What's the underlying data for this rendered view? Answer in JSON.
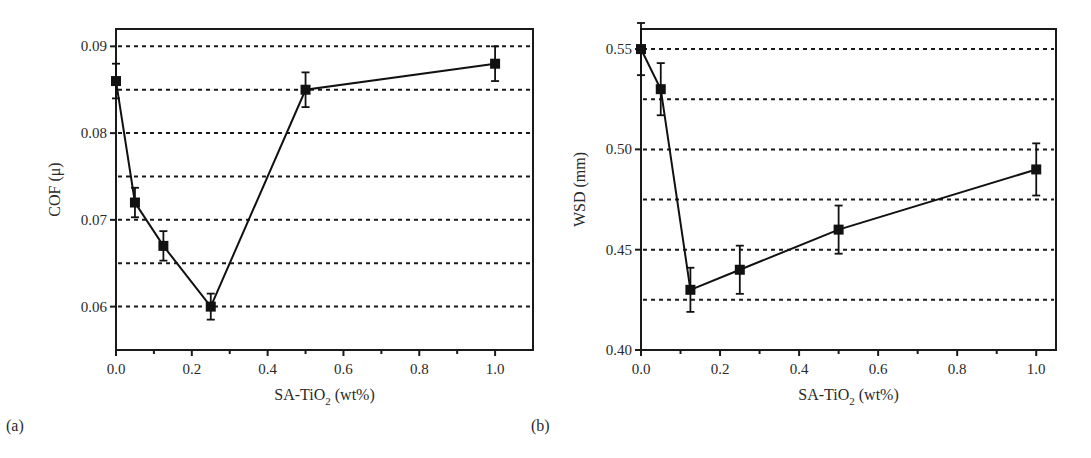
{
  "chart_data": [
    {
      "id": "a",
      "type": "line",
      "panel_label": "(a)",
      "title": "",
      "xlabel": "SA-TiO2 (wt%)",
      "xlabel_main": "SA-TiO",
      "xlabel_sub": "2",
      "xlabel_tail": " (wt%)",
      "ylabel": "COF (μ)",
      "xlim": [
        0.0,
        1.1
      ],
      "ylim": [
        0.055,
        0.092
      ],
      "xticks": [
        0.0,
        0.2,
        0.4,
        0.6,
        0.8,
        1.0
      ],
      "xtick_labels": [
        "0.0",
        "0.2",
        "0.4",
        "0.6",
        "0.8",
        "1.0"
      ],
      "xminor_ticks": [
        0.1,
        0.3,
        0.5,
        0.7,
        0.9
      ],
      "yticks": [
        0.06,
        0.07,
        0.08,
        0.09
      ],
      "ytick_labels": [
        "0.06",
        "0.07",
        "0.08",
        "0.09"
      ],
      "grid": "horizontal dashed",
      "gridlines": [
        0.06,
        0.065,
        0.07,
        0.075,
        0.08,
        0.085,
        0.09
      ],
      "series": [
        {
          "name": "COF",
          "marker": "square",
          "x": [
            0.0,
            0.05,
            0.125,
            0.25,
            0.5,
            1.0
          ],
          "values": [
            0.086,
            0.072,
            0.067,
            0.06,
            0.085,
            0.088
          ],
          "error": [
            0.002,
            0.0017,
            0.0017,
            0.0015,
            0.002,
            0.002
          ]
        }
      ]
    },
    {
      "id": "b",
      "type": "line",
      "panel_label": "(b)",
      "title": "",
      "xlabel": "SA-TiO2 (wt%)",
      "xlabel_main": "SA-TiO",
      "xlabel_sub": "2",
      "xlabel_tail": " (wt%)",
      "ylabel": "WSD (mm)",
      "xlim": [
        0.0,
        1.05
      ],
      "ylim": [
        0.4,
        0.56
      ],
      "xticks": [
        0.0,
        0.2,
        0.4,
        0.6,
        0.8,
        1.0
      ],
      "xtick_labels": [
        "0.0",
        "0.2",
        "0.4",
        "0.6",
        "0.8",
        "1.0"
      ],
      "xminor_ticks": [
        0.1,
        0.3,
        0.5,
        0.7,
        0.9
      ],
      "yticks": [
        0.4,
        0.45,
        0.5,
        0.55
      ],
      "ytick_labels": [
        "0.40",
        "0.45",
        "0.50",
        "0.55"
      ],
      "grid": "horizontal dashed",
      "gridlines": [
        0.425,
        0.45,
        0.475,
        0.5,
        0.525,
        0.55
      ],
      "series": [
        {
          "name": "WSD",
          "marker": "square",
          "x": [
            0.0,
            0.05,
            0.125,
            0.25,
            0.5,
            1.0
          ],
          "values": [
            0.55,
            0.53,
            0.43,
            0.44,
            0.46,
            0.49
          ],
          "error": [
            0.013,
            0.013,
            0.011,
            0.012,
            0.012,
            0.013
          ]
        }
      ]
    }
  ]
}
